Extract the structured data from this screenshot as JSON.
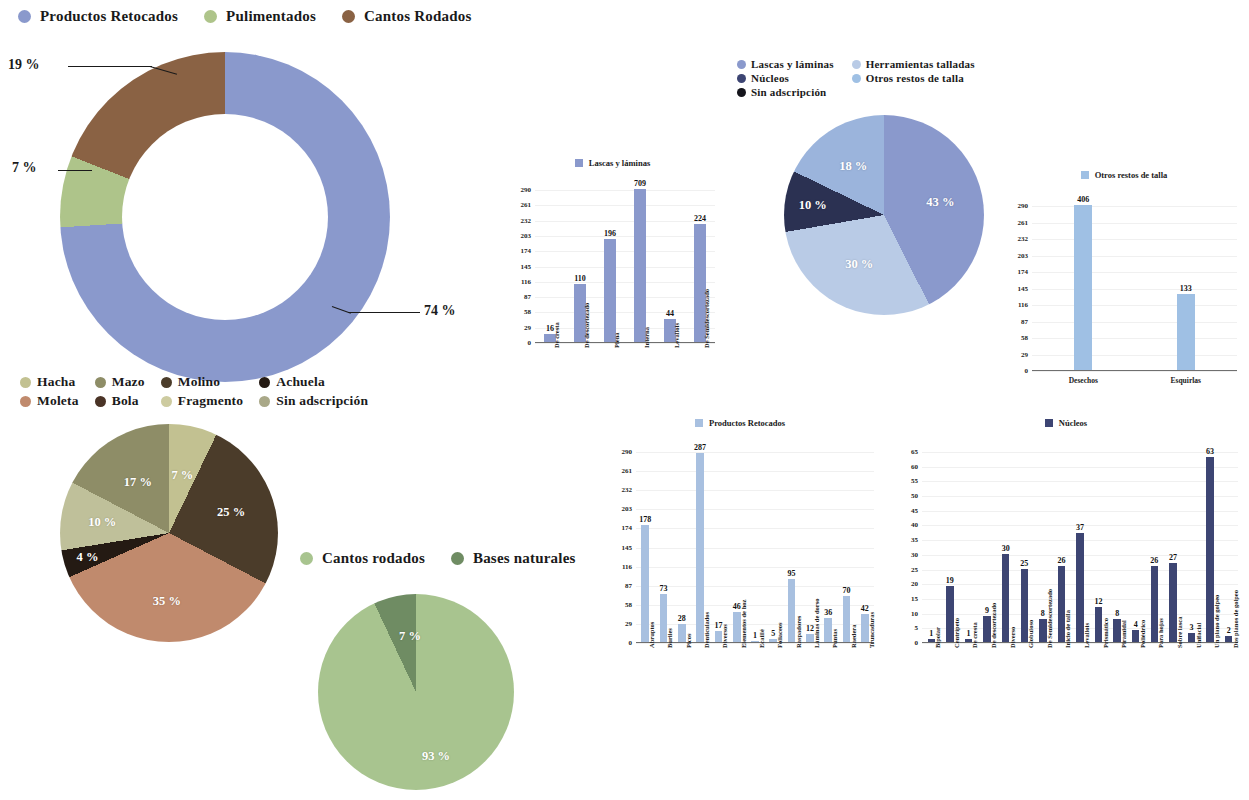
{
  "legends": {
    "top": [
      {
        "label": "Productos Retocados",
        "color": "#8a99cc"
      },
      {
        "label": "Pulimentados",
        "color": "#aec48a"
      },
      {
        "label": "Cantos Rodados",
        "color": "#8a6244"
      }
    ],
    "knapped": [
      {
        "label": "Lascas y láminas",
        "color": "#8a99cc"
      },
      {
        "label": "Herramientas talladas",
        "color": "#b9cbe6"
      },
      {
        "label": "Núcleos",
        "color": "#3d4573"
      },
      {
        "label": "Otros restos de talla",
        "color": "#9fc0e4"
      },
      {
        "label": "Sin adscripción",
        "color": "#15151c"
      }
    ],
    "polished": [
      {
        "label": "Hacha",
        "color": "#c2c191"
      },
      {
        "label": "Mazo",
        "color": "#8e8d67"
      },
      {
        "label": "Molino",
        "color": "#4b3c2a"
      },
      {
        "label": "Achuela",
        "color": "#241a13"
      },
      {
        "label": "Moleta",
        "color": "#c08a6d"
      },
      {
        "label": "Bola",
        "color": "#4a3326"
      },
      {
        "label": "Fragmento",
        "color": "#cdcba0"
      },
      {
        "label": "Sin adscripción",
        "color": "#a9a888"
      }
    ],
    "pebbles": [
      {
        "label": "Cantos rodados",
        "color": "#a8c48f"
      },
      {
        "label": "Bases naturales",
        "color": "#6f8c63"
      }
    ]
  },
  "chart_data": [
    {
      "id": "donut-materials",
      "type": "pie",
      "donut": true,
      "title": "",
      "categories": [
        "Productos Retocados",
        "Pulimentados",
        "Cantos Rodados"
      ],
      "values": [
        74,
        7,
        19
      ],
      "labels": [
        "74 %",
        "7 %",
        "19 %"
      ],
      "colors": [
        "#8a99cc",
        "#aec48a",
        "#8a6244"
      ],
      "legend_position": "top"
    },
    {
      "id": "bar-lascas",
      "type": "bar",
      "title": "Lascas y láminas",
      "series_color": "#8a99cc",
      "categories": [
        "De cresta",
        "De descortezado",
        "Plena",
        "Interna",
        "Levallois",
        "De Semidescortezado"
      ],
      "values": [
        16,
        110,
        196,
        709,
        44,
        224
      ],
      "ylim": [
        0,
        290
      ],
      "yticks": [
        0,
        29,
        58,
        87,
        116,
        145,
        174,
        203,
        232,
        261,
        290
      ],
      "xlabel": "",
      "ylabel": "",
      "grid": true
    },
    {
      "id": "pie-knapped",
      "type": "pie",
      "title": "",
      "categories": [
        "Lascas y láminas",
        "Otros restos de talla",
        "Núcleos",
        "Herramientas talladas"
      ],
      "values": [
        43,
        30,
        10,
        18
      ],
      "labels": [
        "43 %",
        "30 %",
        "10 %",
        "18 %"
      ],
      "colors": [
        "#8a99cc",
        "#b9cbe6",
        "#2b3152",
        "#9bb4dc"
      ],
      "legend_position": "top"
    },
    {
      "id": "bar-otros-restos",
      "type": "bar",
      "title": "Otros restos de talla",
      "series_color": "#9fc0e4",
      "categories": [
        "Desechos",
        "Esquirlas"
      ],
      "values": [
        406,
        133
      ],
      "ylim": [
        0,
        290
      ],
      "yticks": [
        0,
        29,
        58,
        87,
        116,
        145,
        174,
        203,
        232,
        261,
        290
      ],
      "xlabel": "",
      "ylabel": "",
      "grid": true
    },
    {
      "id": "pie-polished",
      "type": "pie",
      "title": "",
      "categories": [
        "Hacha",
        "Molino",
        "Moleta",
        "Achuela",
        "Fragmento",
        "Mazo"
      ],
      "values": [
        7,
        25,
        35,
        4,
        10,
        17
      ],
      "labels": [
        "7 %",
        "25 %",
        "35 %",
        "4 %",
        "10 %",
        "17 %"
      ],
      "colors": [
        "#c2c191",
        "#4b3c2a",
        "#c08a6d",
        "#241a13",
        "#bfc09a",
        "#8e8d67"
      ],
      "legend_position": "top"
    },
    {
      "id": "pie-pebbles",
      "type": "pie",
      "title": "",
      "categories": [
        "Cantos rodados",
        "Bases naturales"
      ],
      "values": [
        93,
        7
      ],
      "labels": [
        "93 %",
        "7 %"
      ],
      "colors": [
        "#a8c48f",
        "#6f8c63"
      ],
      "legend_position": "top"
    },
    {
      "id": "bar-retocados",
      "type": "bar",
      "title": "Productos Retocados",
      "series_color": "#a8c0e0",
      "categories": [
        "Abruptos",
        "Buriles",
        "Picos",
        "Denticulados",
        "Diversos",
        "Elementos de hoz",
        "Ecaillé",
        "Foliaceos",
        "Raspadores",
        "Láminas de dorso",
        "Puntas",
        "Raedera",
        "Truncaduras"
      ],
      "values": [
        178,
        73,
        28,
        287,
        17,
        46,
        1,
        5,
        95,
        12,
        36,
        70,
        42
      ],
      "ylim": [
        0,
        290
      ],
      "yticks": [
        0,
        29,
        58,
        87,
        116,
        145,
        174,
        203,
        232,
        261,
        290
      ],
      "xlabel": "",
      "ylabel": "",
      "grid": true
    },
    {
      "id": "bar-nucleos",
      "type": "bar",
      "title": "Núcleos",
      "series_color": "#3d4573",
      "categories": [
        "Bipolar",
        "Centrípeto",
        "De cresta",
        "De descortezado",
        "Diverso",
        "Globuloso",
        "De Semidescortezado",
        "Inicio de talla",
        "Levallois",
        "Prismático",
        "Piramidal",
        "Poliédrico",
        "Para hojas",
        "Sobre lasca",
        "Unifacial",
        "Un plano de golpeo",
        "Dos planos de golpeo"
      ],
      "values": [
        1,
        19,
        1,
        9,
        30,
        25,
        8,
        26,
        37,
        12,
        8,
        4,
        26,
        27,
        3,
        63,
        2
      ],
      "ylim": [
        0,
        65
      ],
      "yticks": [
        0,
        5,
        10,
        15,
        20,
        25,
        30,
        35,
        40,
        45,
        50,
        55,
        60,
        65
      ],
      "xlabel": "",
      "ylabel": "",
      "grid": true
    }
  ]
}
